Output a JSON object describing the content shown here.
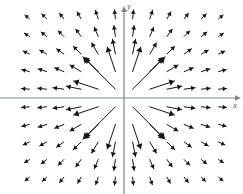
{
  "figure": {
    "width": 243,
    "height": 194,
    "background_color": "#ffffff"
  },
  "axes": {
    "x_axis": {
      "label": "x",
      "color": "#7e8589",
      "y_pixel": 98,
      "x_start": 0,
      "x_end": 243,
      "has_arrowhead": true,
      "label_x": 233,
      "label_y": 101
    },
    "y_axis": {
      "label": "y",
      "color": "#7e8589",
      "x_pixel": 124,
      "y_start": 5,
      "y_end": 194,
      "has_arrowhead": true,
      "label_x": 127,
      "label_y": 2
    },
    "origin": {
      "x": 124,
      "y": 98
    }
  },
  "chart_data": {
    "type": "scatter",
    "subtype": "vector-field-quiver",
    "title": "",
    "xlabel": "x",
    "ylabel": "y",
    "grid": false,
    "legend": null,
    "field_formula": "F(x,y) = (x, y) / (x^2 + y^2)",
    "xlim": [
      -6.5,
      6.5
    ],
    "ylim": [
      -5.5,
      5.5
    ],
    "grid_columns": 12,
    "grid_rows": 10,
    "x_samples": [
      -5.5,
      -4.5,
      -3.5,
      -2.5,
      -1.5,
      -0.5,
      0.5,
      1.5,
      2.5,
      3.5,
      4.5,
      5.5
    ],
    "y_samples": [
      4.5,
      3.5,
      2.5,
      1.5,
      0.5,
      -0.5,
      -1.5,
      -2.5,
      -3.5,
      -4.5
    ],
    "arrow_color": "#141414",
    "arrow_line_width": 1,
    "max_arrow_length_px": 48,
    "min_arrow_length_px": 5,
    "cell_width_px": 17.2,
    "cell_height_px": 17.6,
    "points": [
      {
        "x": -5.5,
        "y": 4.5,
        "u": -0.763,
        "v": 0.624,
        "len": 6
      },
      {
        "x": -4.5,
        "y": 4.5,
        "u": -0.707,
        "v": 0.707,
        "len": 7
      },
      {
        "x": -3.5,
        "y": 4.5,
        "u": -0.614,
        "v": 0.789,
        "len": 7
      },
      {
        "x": -2.5,
        "y": 4.5,
        "u": -0.486,
        "v": 0.874,
        "len": 8
      },
      {
        "x": -1.5,
        "y": 4.5,
        "u": -0.316,
        "v": 0.949,
        "len": 9
      },
      {
        "x": -0.5,
        "y": 4.5,
        "u": -0.11,
        "v": 0.994,
        "len": 9
      },
      {
        "x": 0.5,
        "y": 4.5,
        "u": 0.11,
        "v": 0.994,
        "len": 9
      },
      {
        "x": 1.5,
        "y": 4.5,
        "u": 0.316,
        "v": 0.949,
        "len": 9
      },
      {
        "x": 2.5,
        "y": 4.5,
        "u": 0.486,
        "v": 0.874,
        "len": 8
      },
      {
        "x": 3.5,
        "y": 4.5,
        "u": 0.614,
        "v": 0.789,
        "len": 7
      },
      {
        "x": 4.5,
        "y": 4.5,
        "u": 0.707,
        "v": 0.707,
        "len": 7
      },
      {
        "x": 5.5,
        "y": 4.5,
        "u": 0.763,
        "v": 0.624,
        "len": 6
      },
      {
        "x": -5.5,
        "y": 3.5,
        "u": -0.844,
        "v": 0.537,
        "len": 6
      },
      {
        "x": -4.5,
        "y": 3.5,
        "u": -0.79,
        "v": 0.614,
        "len": 7
      },
      {
        "x": -3.5,
        "y": 3.5,
        "u": -0.707,
        "v": 0.707,
        "len": 8
      },
      {
        "x": -2.5,
        "y": 3.5,
        "u": -0.581,
        "v": 0.814,
        "len": 9
      },
      {
        "x": -1.5,
        "y": 3.5,
        "u": -0.394,
        "v": 0.919,
        "len": 10
      },
      {
        "x": -0.5,
        "y": 3.5,
        "u": -0.141,
        "v": 0.99,
        "len": 11
      },
      {
        "x": 0.5,
        "y": 3.5,
        "u": 0.141,
        "v": 0.99,
        "len": 11
      },
      {
        "x": 1.5,
        "y": 3.5,
        "u": 0.394,
        "v": 0.919,
        "len": 10
      },
      {
        "x": 2.5,
        "y": 3.5,
        "u": 0.581,
        "v": 0.814,
        "len": 9
      },
      {
        "x": 3.5,
        "y": 3.5,
        "u": 0.707,
        "v": 0.707,
        "len": 8
      },
      {
        "x": 4.5,
        "y": 3.5,
        "u": 0.79,
        "v": 0.614,
        "len": 7
      },
      {
        "x": 5.5,
        "y": 3.5,
        "u": 0.844,
        "v": 0.537,
        "len": 6
      },
      {
        "x": -5.5,
        "y": 2.5,
        "u": -0.91,
        "v": 0.414,
        "len": 7
      },
      {
        "x": -4.5,
        "y": 2.5,
        "u": -0.874,
        "v": 0.486,
        "len": 8
      },
      {
        "x": -3.5,
        "y": 2.5,
        "u": -0.814,
        "v": 0.581,
        "len": 9
      },
      {
        "x": -2.5,
        "y": 2.5,
        "u": -0.707,
        "v": 0.707,
        "len": 11
      },
      {
        "x": -1.5,
        "y": 2.5,
        "u": -0.514,
        "v": 0.857,
        "len": 13
      },
      {
        "x": -0.5,
        "y": 2.5,
        "u": -0.196,
        "v": 0.981,
        "len": 15
      },
      {
        "x": 0.5,
        "y": 2.5,
        "u": 0.196,
        "v": 0.981,
        "len": 15
      },
      {
        "x": 1.5,
        "y": 2.5,
        "u": 0.514,
        "v": 0.857,
        "len": 13
      },
      {
        "x": 2.5,
        "y": 2.5,
        "u": 0.707,
        "v": 0.707,
        "len": 11
      },
      {
        "x": 3.5,
        "y": 2.5,
        "u": 0.814,
        "v": 0.581,
        "len": 9
      },
      {
        "x": 4.5,
        "y": 2.5,
        "u": 0.874,
        "v": 0.486,
        "len": 8
      },
      {
        "x": 5.5,
        "y": 2.5,
        "u": 0.91,
        "v": 0.414,
        "len": 7
      },
      {
        "x": -5.5,
        "y": 1.5,
        "u": -0.965,
        "v": 0.263,
        "len": 8
      },
      {
        "x": -4.5,
        "y": 1.5,
        "u": -0.949,
        "v": 0.316,
        "len": 9
      },
      {
        "x": -3.5,
        "y": 1.5,
        "u": -0.919,
        "v": 0.394,
        "len": 10
      },
      {
        "x": -2.5,
        "y": 1.5,
        "u": -0.857,
        "v": 0.514,
        "len": 13
      },
      {
        "x": -1.5,
        "y": 1.5,
        "u": -0.707,
        "v": 0.707,
        "len": 18
      },
      {
        "x": -0.5,
        "y": 1.5,
        "u": -0.316,
        "v": 0.949,
        "len": 26
      },
      {
        "x": 0.5,
        "y": 1.5,
        "u": 0.316,
        "v": 0.949,
        "len": 26
      },
      {
        "x": 1.5,
        "y": 1.5,
        "u": 0.707,
        "v": 0.707,
        "len": 18
      },
      {
        "x": 2.5,
        "y": 1.5,
        "u": 0.857,
        "v": 0.514,
        "len": 13
      },
      {
        "x": 3.5,
        "y": 1.5,
        "u": 0.919,
        "v": 0.394,
        "len": 10
      },
      {
        "x": 4.5,
        "y": 1.5,
        "u": 0.949,
        "v": 0.316,
        "len": 9
      },
      {
        "x": 5.5,
        "y": 1.5,
        "u": 0.965,
        "v": 0.263,
        "len": 8
      },
      {
        "x": -5.5,
        "y": 0.5,
        "u": -0.996,
        "v": 0.091,
        "len": 8
      },
      {
        "x": -4.5,
        "y": 0.5,
        "u": -0.994,
        "v": 0.11,
        "len": 9
      },
      {
        "x": -3.5,
        "y": 0.5,
        "u": -0.99,
        "v": 0.141,
        "len": 11
      },
      {
        "x": -2.5,
        "y": 0.5,
        "u": -0.981,
        "v": 0.196,
        "len": 15
      },
      {
        "x": -1.5,
        "y": 0.5,
        "u": -0.949,
        "v": 0.316,
        "len": 26
      },
      {
        "x": -0.5,
        "y": 0.5,
        "u": -0.707,
        "v": 0.707,
        "len": 46
      },
      {
        "x": 0.5,
        "y": 0.5,
        "u": 0.707,
        "v": 0.707,
        "len": 46
      },
      {
        "x": 1.5,
        "y": 0.5,
        "u": 0.949,
        "v": 0.316,
        "len": 26
      },
      {
        "x": 2.5,
        "y": 0.5,
        "u": 0.981,
        "v": 0.196,
        "len": 15
      },
      {
        "x": 3.5,
        "y": 0.5,
        "u": 0.99,
        "v": 0.141,
        "len": 11
      },
      {
        "x": 4.5,
        "y": 0.5,
        "u": 0.994,
        "v": 0.11,
        "len": 9
      },
      {
        "x": 5.5,
        "y": 0.5,
        "u": 0.996,
        "v": 0.091,
        "len": 8
      },
      {
        "x": -5.5,
        "y": -0.5,
        "u": -0.996,
        "v": -0.091,
        "len": 8
      },
      {
        "x": -4.5,
        "y": -0.5,
        "u": -0.994,
        "v": -0.11,
        "len": 9
      },
      {
        "x": -3.5,
        "y": -0.5,
        "u": -0.99,
        "v": -0.141,
        "len": 11
      },
      {
        "x": -2.5,
        "y": -0.5,
        "u": -0.981,
        "v": -0.196,
        "len": 15
      },
      {
        "x": -1.5,
        "y": -0.5,
        "u": -0.949,
        "v": -0.316,
        "len": 26
      },
      {
        "x": -0.5,
        "y": -0.5,
        "u": -0.707,
        "v": -0.707,
        "len": 46
      },
      {
        "x": 0.5,
        "y": -0.5,
        "u": 0.707,
        "v": -0.707,
        "len": 46
      },
      {
        "x": 1.5,
        "y": -0.5,
        "u": 0.949,
        "v": -0.316,
        "len": 26
      },
      {
        "x": 2.5,
        "y": -0.5,
        "u": 0.981,
        "v": -0.196,
        "len": 15
      },
      {
        "x": 3.5,
        "y": -0.5,
        "u": 0.99,
        "v": -0.141,
        "len": 11
      },
      {
        "x": 4.5,
        "y": -0.5,
        "u": 0.994,
        "v": -0.11,
        "len": 9
      },
      {
        "x": 5.5,
        "y": -0.5,
        "u": 0.996,
        "v": -0.091,
        "len": 8
      },
      {
        "x": -5.5,
        "y": -1.5,
        "u": -0.965,
        "v": -0.263,
        "len": 8
      },
      {
        "x": -4.5,
        "y": -1.5,
        "u": -0.949,
        "v": -0.316,
        "len": 9
      },
      {
        "x": -3.5,
        "y": -1.5,
        "u": -0.919,
        "v": -0.394,
        "len": 10
      },
      {
        "x": -2.5,
        "y": -1.5,
        "u": -0.857,
        "v": -0.514,
        "len": 13
      },
      {
        "x": -1.5,
        "y": -1.5,
        "u": -0.707,
        "v": -0.707,
        "len": 18
      },
      {
        "x": -0.5,
        "y": -1.5,
        "u": -0.316,
        "v": -0.949,
        "len": 26
      },
      {
        "x": 0.5,
        "y": -1.5,
        "u": 0.316,
        "v": -0.949,
        "len": 26
      },
      {
        "x": 1.5,
        "y": -1.5,
        "u": 0.707,
        "v": -0.707,
        "len": 18
      },
      {
        "x": 2.5,
        "y": -1.5,
        "u": 0.857,
        "v": -0.514,
        "len": 13
      },
      {
        "x": 3.5,
        "y": -1.5,
        "u": 0.919,
        "v": -0.394,
        "len": 10
      },
      {
        "x": 4.5,
        "y": -1.5,
        "u": 0.949,
        "v": -0.316,
        "len": 9
      },
      {
        "x": 5.5,
        "y": -1.5,
        "u": 0.965,
        "v": -0.263,
        "len": 8
      },
      {
        "x": -5.5,
        "y": -2.5,
        "u": -0.91,
        "v": -0.414,
        "len": 7
      },
      {
        "x": -4.5,
        "y": -2.5,
        "u": -0.874,
        "v": -0.486,
        "len": 8
      },
      {
        "x": -3.5,
        "y": -2.5,
        "u": -0.814,
        "v": -0.581,
        "len": 9
      },
      {
        "x": -2.5,
        "y": -2.5,
        "u": -0.707,
        "v": -0.707,
        "len": 11
      },
      {
        "x": -1.5,
        "y": -2.5,
        "u": -0.514,
        "v": -0.857,
        "len": 13
      },
      {
        "x": -0.5,
        "y": -2.5,
        "u": -0.196,
        "v": -0.981,
        "len": 15
      },
      {
        "x": 0.5,
        "y": -2.5,
        "u": 0.196,
        "v": -0.981,
        "len": 15
      },
      {
        "x": 1.5,
        "y": -2.5,
        "u": 0.514,
        "v": -0.857,
        "len": 13
      },
      {
        "x": 2.5,
        "y": -2.5,
        "u": 0.707,
        "v": -0.707,
        "len": 11
      },
      {
        "x": 3.5,
        "y": -2.5,
        "u": 0.814,
        "v": -0.581,
        "len": 9
      },
      {
        "x": 4.5,
        "y": -2.5,
        "u": 0.874,
        "v": -0.486,
        "len": 8
      },
      {
        "x": 5.5,
        "y": -2.5,
        "u": 0.91,
        "v": -0.414,
        "len": 7
      },
      {
        "x": -5.5,
        "y": -3.5,
        "u": -0.844,
        "v": -0.537,
        "len": 6
      },
      {
        "x": -4.5,
        "y": -3.5,
        "u": -0.79,
        "v": -0.614,
        "len": 7
      },
      {
        "x": -3.5,
        "y": -3.5,
        "u": -0.707,
        "v": -0.707,
        "len": 8
      },
      {
        "x": -2.5,
        "y": -3.5,
        "u": -0.581,
        "v": -0.814,
        "len": 9
      },
      {
        "x": -1.5,
        "y": -3.5,
        "u": -0.394,
        "v": -0.919,
        "len": 10
      },
      {
        "x": -0.5,
        "y": -3.5,
        "u": -0.141,
        "v": -0.99,
        "len": 11
      },
      {
        "x": 0.5,
        "y": -3.5,
        "u": 0.141,
        "v": -0.99,
        "len": 11
      },
      {
        "x": 1.5,
        "y": -3.5,
        "u": 0.394,
        "v": -0.919,
        "len": 10
      },
      {
        "x": 2.5,
        "y": -3.5,
        "u": 0.581,
        "v": -0.814,
        "len": 9
      },
      {
        "x": 3.5,
        "y": -3.5,
        "u": 0.707,
        "v": -0.707,
        "len": 8
      },
      {
        "x": 4.5,
        "y": -3.5,
        "u": 0.79,
        "v": -0.614,
        "len": 7
      },
      {
        "x": 5.5,
        "y": -3.5,
        "u": 0.844,
        "v": -0.537,
        "len": 6
      },
      {
        "x": -5.5,
        "y": -4.5,
        "u": -0.763,
        "v": -0.624,
        "len": 6
      },
      {
        "x": -4.5,
        "y": -4.5,
        "u": -0.707,
        "v": -0.707,
        "len": 6
      },
      {
        "x": -3.5,
        "y": -4.5,
        "u": -0.614,
        "v": -0.789,
        "len": 7
      },
      {
        "x": -2.5,
        "y": -4.5,
        "u": -0.486,
        "v": -0.874,
        "len": 7
      },
      {
        "x": -1.5,
        "y": -4.5,
        "u": -0.316,
        "v": -0.949,
        "len": 8
      },
      {
        "x": -0.5,
        "y": -4.5,
        "u": -0.11,
        "v": -0.994,
        "len": 8
      },
      {
        "x": 0.5,
        "y": -4.5,
        "u": 0.11,
        "v": -0.994,
        "len": 8
      },
      {
        "x": 1.5,
        "y": -4.5,
        "u": 0.316,
        "v": -0.949,
        "len": 8
      },
      {
        "x": 2.5,
        "y": -4.5,
        "u": 0.486,
        "v": -0.874,
        "len": 7
      },
      {
        "x": 3.5,
        "y": -4.5,
        "u": 0.614,
        "v": -0.789,
        "len": 7
      },
      {
        "x": 4.5,
        "y": -4.5,
        "u": 0.707,
        "v": -0.707,
        "len": 6
      },
      {
        "x": 5.5,
        "y": -4.5,
        "u": 0.763,
        "v": -0.624,
        "len": 6
      }
    ]
  }
}
